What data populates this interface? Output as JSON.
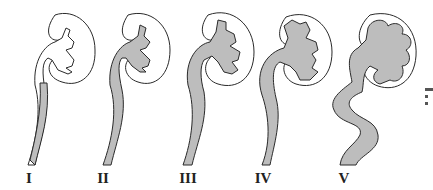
{
  "figure": {
    "grades": [
      {
        "label": "I",
        "x": 29
      },
      {
        "label": "II",
        "x": 103
      },
      {
        "label": "III",
        "x": 188
      },
      {
        "label": "IV",
        "x": 263
      },
      {
        "label": "V",
        "x": 344
      }
    ],
    "colors": {
      "reflux_fill": "#bdbdbd",
      "outline": "#2a2a2a",
      "background": "#ffffff"
    }
  }
}
